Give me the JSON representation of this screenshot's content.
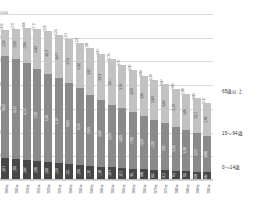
{
  "chart_data": {
    "type": "bar",
    "subtype": "stacked-column",
    "title": "",
    "xlabel": "",
    "ylabel": "",
    "ylim": [
      0,
      14000
    ],
    "grid": true,
    "legend_position": "right",
    "categories": [
      "2000年",
      "2005年",
      "2010年",
      "2015年",
      "2020年",
      "2025年",
      "2030年",
      "2035年",
      "2040年",
      "2045年",
      "2050年",
      "2055年",
      "2060年",
      "2065年",
      "2070年",
      "2075年",
      "2080年",
      "2085年",
      "2090年",
      "2095年"
    ],
    "series": [
      {
        "name": "0～14歳",
        "color": "#474747",
        "values": [
          1847,
          1759,
          1684,
          1595,
          1503,
          1407,
          1321,
          1246,
          1194,
          1138,
          1077,
          1012,
          951,
          898,
          854,
          812,
          773,
          735,
          699,
          664
        ]
      },
      {
        "name": "15～64歳",
        "color": "#8a8a8a",
        "values": [
          8622,
          8442,
          8174,
          7728,
          7406,
          7170,
          6875,
          6494,
          5978,
          5584,
          5275,
          5028,
          4793,
          4529,
          4235,
          3971,
          3725,
          3490,
          3272,
          3066
        ]
      },
      {
        "name": "65歳以上",
        "color": "#c2c2c2",
        "values": [
          2204,
          2576,
          2948,
          3387,
          3619,
          3677,
          3716,
          3782,
          3921,
          3919,
          3841,
          3704,
          3540,
          3381,
          3367,
          3304,
          3197,
          3061,
          2912,
          2764
        ]
      }
    ],
    "totals": [
      12673,
      12777,
      12806,
      12710,
      12528,
      12254,
      11912,
      11522,
      11093,
      10641,
      10193,
      9744,
      9284,
      8808,
      8456,
      8087,
      7695,
      7286,
      6883,
      6494
    ],
    "yticks": [
      "0",
      "2,000",
      "4,000",
      "6,000",
      "8,000",
      "10,000",
      "12,000",
      "14,000"
    ]
  },
  "legend": {
    "old_label": "65歳以上",
    "mid_label": "15～64歳",
    "young_label": "0～14歳"
  },
  "colors": {
    "old": "#c2c2c2",
    "mid": "#8a8a8a",
    "young": "#474747",
    "grid": "#d9d9d9",
    "axis": "#bdbdbd",
    "background": "#ffffff"
  }
}
